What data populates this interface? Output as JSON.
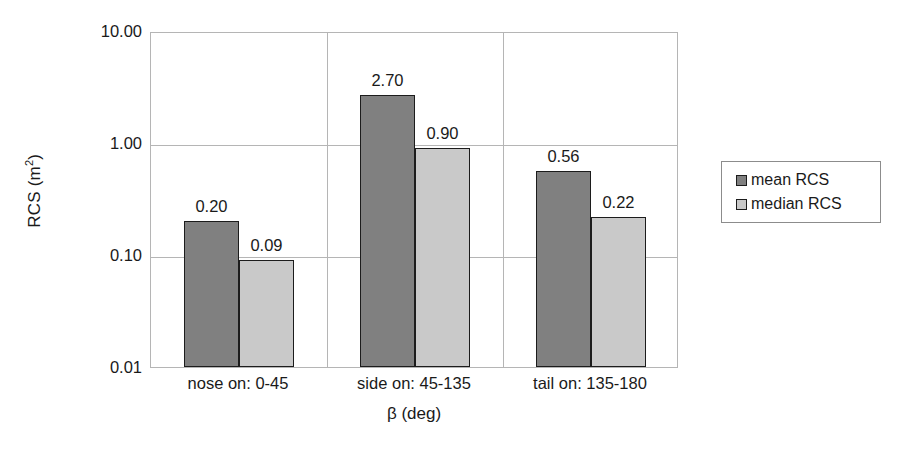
{
  "chart_data": {
    "type": "bar",
    "title": "",
    "subtitle": "",
    "xlabel": "β (deg)",
    "ylabel": "RCS (m²)",
    "ylabel_base": "RCS (m",
    "ylabel_sup": "2",
    "ylabel_tail": ")",
    "yscale": "log",
    "ylim": [
      0.01,
      10.0
    ],
    "grid": true,
    "legend_position": "right",
    "categories": [
      "nose on:  0-45",
      "side on: 45-135",
      "tail on: 135-180"
    ],
    "series": [
      {
        "name": "mean RCS",
        "color": "#808080",
        "values": [
          0.2,
          2.7,
          0.56
        ],
        "labels": [
          "0.20",
          "2.70",
          "0.56"
        ]
      },
      {
        "name": "median RCS",
        "color": "#c9c9c9",
        "values": [
          0.09,
          0.9,
          0.22
        ],
        "labels": [
          "0.09",
          "0.90",
          "0.22"
        ]
      }
    ],
    "ytick_values": [
      10.0,
      1.0,
      0.1,
      0.01
    ],
    "ytick_labels": [
      "10.00",
      "1.00",
      "0.10",
      "0.01"
    ],
    "group_separators": 2
  },
  "legend": {
    "entries": [
      {
        "label": "mean RCS",
        "swatch": "mean"
      },
      {
        "label": "median RCS",
        "swatch": "median"
      }
    ]
  }
}
